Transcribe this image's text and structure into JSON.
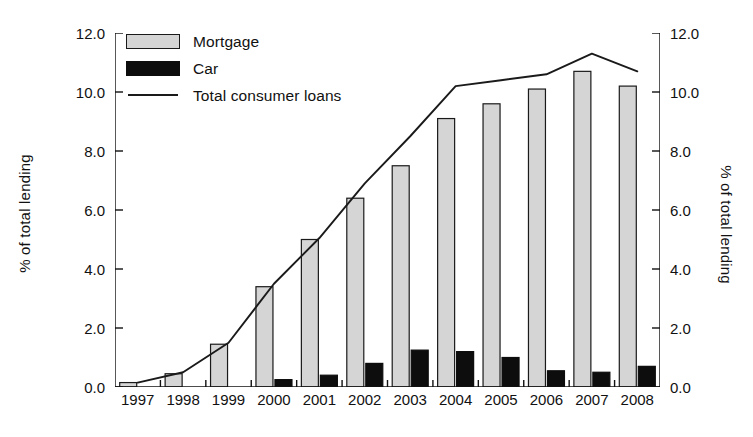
{
  "chart_data": {
    "type": "bar",
    "title": "",
    "xlabel": "",
    "ylabel": "% of total lending",
    "y2label": "% of total lending",
    "ylim": [
      0,
      12
    ],
    "yticks": [
      "0.0",
      "2.0",
      "4.0",
      "6.0",
      "8.0",
      "10.0",
      "12.0"
    ],
    "ytick_values": [
      0,
      2,
      4,
      6,
      8,
      10,
      12
    ],
    "y2ticks": [
      "0.0",
      "2.0",
      "4.0",
      "6.0",
      "8.0",
      "10.0",
      "12.0"
    ],
    "grid": false,
    "legend_position": "top-left",
    "categories": [
      "1997",
      "1998",
      "1999",
      "2000",
      "2001",
      "2002",
      "2003",
      "2004",
      "2005",
      "2006",
      "2007",
      "2008"
    ],
    "series": [
      {
        "name": "Mortgage",
        "kind": "bar",
        "color": "#d5d5d5",
        "edge_color": "#1a1a1a",
        "values": [
          0.15,
          0.45,
          1.45,
          3.4,
          5.0,
          6.4,
          7.5,
          9.1,
          9.6,
          10.1,
          10.7,
          10.2
        ]
      },
      {
        "name": "Car",
        "kind": "bar",
        "color": "#0d0d0d",
        "edge_color": "#0d0d0d",
        "values": [
          0.0,
          0.0,
          0.0,
          0.25,
          0.4,
          0.8,
          1.25,
          1.2,
          1.0,
          0.55,
          0.5,
          0.7
        ]
      },
      {
        "name": "Total consumer loans",
        "kind": "line",
        "color": "#1a1a1a",
        "values": [
          0.15,
          0.5,
          1.5,
          3.5,
          5.05,
          6.9,
          8.5,
          10.2,
          10.4,
          10.6,
          11.3,
          10.7
        ]
      }
    ]
  },
  "legend": {
    "items": [
      {
        "label": "Mortgage",
        "key": "swatch-gray"
      },
      {
        "label": "Car",
        "key": "swatch-black"
      },
      {
        "label": "Total consumer loans",
        "key": "line-sample"
      }
    ]
  },
  "axes": {
    "left_title": "% of total lending",
    "right_title": "% of total lending"
  }
}
